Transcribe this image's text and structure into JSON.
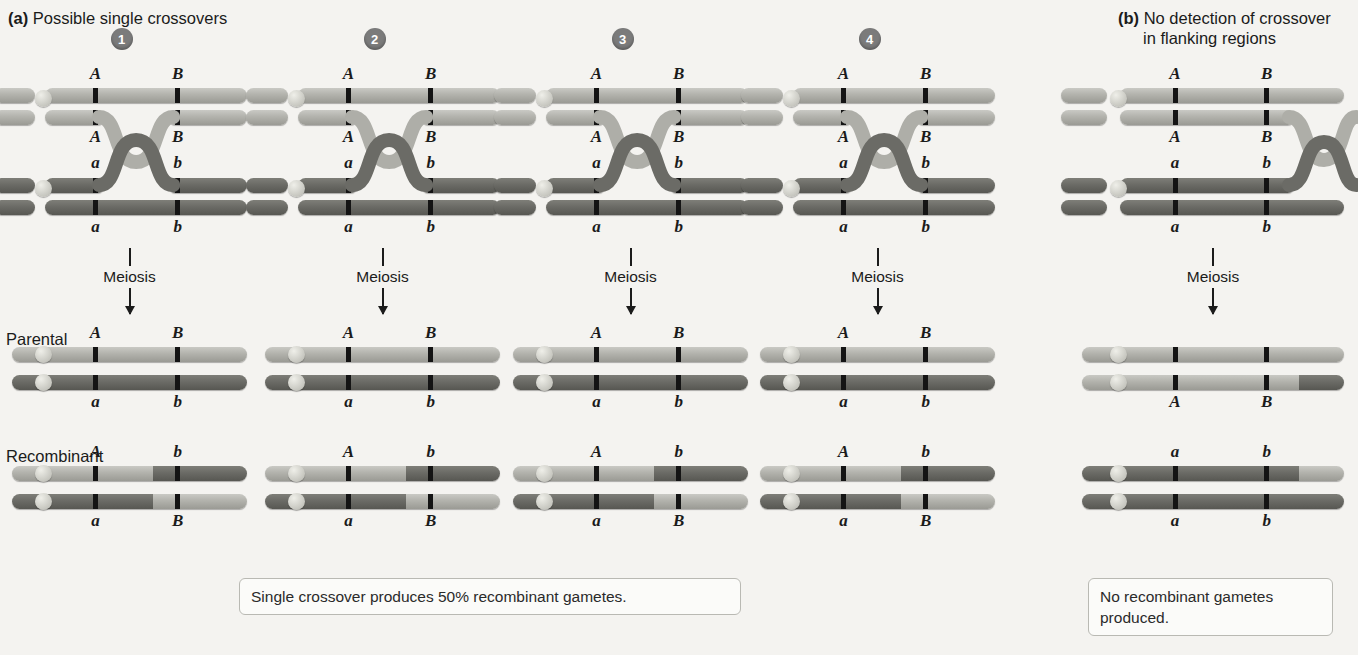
{
  "figure": {
    "background": "#f4f3f0",
    "light_chromatid_color": "#b2b2ac",
    "dark_chromatid_color": "#6b6b66",
    "marker_color": "#141414",
    "badge_color": "#7b7b7b"
  },
  "panels": {
    "a": {
      "tag": "(a)",
      "title": "Possible single crossovers"
    },
    "b": {
      "tag": "(b)",
      "title_line1": "No detection of crossover",
      "title_line2": "in flanking regions"
    }
  },
  "row_labels": {
    "parental": "Parental",
    "recombinant": "Recombinant"
  },
  "meiosis_label": "Meiosis",
  "alleles": {
    "A_upper": "A",
    "B_upper": "B",
    "a_lower": "a",
    "b_lower": "b"
  },
  "columns": [
    {
      "id": 1,
      "badge": "1",
      "tetrad": {
        "top_labels_above": [
          "A",
          "B"
        ],
        "top_labels_below": [
          "A",
          "B"
        ],
        "bottom_labels_above": [
          "a",
          "b"
        ],
        "bottom_labels_below": [
          "a",
          "b"
        ],
        "crossover_type": "inner-chromatids-single"
      },
      "parental": [
        {
          "labels_above": [
            "A",
            "B"
          ],
          "shade": "light"
        },
        {
          "labels_below": [
            "a",
            "b"
          ],
          "shade": "dark"
        }
      ],
      "recombinant": [
        {
          "labels_above": [
            "A",
            "b"
          ],
          "shade": "light-then-dark"
        },
        {
          "labels_below": [
            "a",
            "B"
          ],
          "shade": "dark-then-light"
        }
      ]
    },
    {
      "id": 2,
      "badge": "2",
      "tetrad": {
        "top_labels_above": [
          "A",
          "B"
        ],
        "top_labels_below": [
          "A",
          "B"
        ],
        "bottom_labels_above": [
          "a",
          "b"
        ],
        "bottom_labels_below": [
          "a",
          "b"
        ],
        "crossover_type": "inner-chromatids-single"
      },
      "parental": [
        {
          "labels_above": [
            "A",
            "B"
          ],
          "shade": "light"
        },
        {
          "labels_below": [
            "a",
            "b"
          ],
          "shade": "dark"
        }
      ],
      "recombinant": [
        {
          "labels_above": [
            "A",
            "b"
          ],
          "shade": "light-then-dark"
        },
        {
          "labels_below": [
            "a",
            "B"
          ],
          "shade": "dark-then-light"
        }
      ]
    },
    {
      "id": 3,
      "badge": "3",
      "tetrad": {
        "top_labels_above": [
          "A",
          "B"
        ],
        "top_labels_below": [
          "A",
          "B"
        ],
        "bottom_labels_above": [
          "a",
          "b"
        ],
        "bottom_labels_below": [
          "a",
          "b"
        ],
        "crossover_type": "inner-chromatids-single"
      },
      "parental": [
        {
          "labels_above": [
            "A",
            "B"
          ],
          "shade": "light"
        },
        {
          "labels_below": [
            "a",
            "b"
          ],
          "shade": "dark"
        }
      ],
      "recombinant": [
        {
          "labels_above": [
            "A",
            "b"
          ],
          "shade": "light-then-dark"
        },
        {
          "labels_below": [
            "a",
            "B"
          ],
          "shade": "dark-then-light"
        }
      ]
    },
    {
      "id": 4,
      "badge": "4",
      "tetrad": {
        "top_labels_above": [
          "A",
          "B"
        ],
        "top_labels_below": [
          "A",
          "B"
        ],
        "bottom_labels_above": [
          "a",
          "b"
        ],
        "bottom_labels_below": [
          "a",
          "b"
        ],
        "crossover_type": "inner-chromatids-single"
      },
      "parental": [
        {
          "labels_above": [
            "A",
            "B"
          ],
          "shade": "light"
        },
        {
          "labels_below": [
            "a",
            "b"
          ],
          "shade": "dark"
        }
      ],
      "recombinant": [
        {
          "labels_above": [
            "A",
            "b"
          ],
          "shade": "light-then-dark"
        },
        {
          "labels_below": [
            "a",
            "B"
          ],
          "shade": "dark-then-light"
        }
      ]
    },
    {
      "id": 5,
      "badge": null,
      "tetrad": {
        "top_labels_above": [
          "A",
          "B"
        ],
        "top_labels_below": [
          "A",
          "B"
        ],
        "bottom_labels_above": [
          "a",
          "b"
        ],
        "bottom_labels_below": [
          "a",
          "b"
        ],
        "crossover_type": "flanking-region-right-of-B"
      },
      "parental": [
        {
          "labels": [],
          "shade": "light"
        },
        {
          "labels_below": [
            "A",
            "B"
          ],
          "shade": "light-with-dark-tip"
        }
      ],
      "recombinant": [
        {
          "labels_above": [
            "a",
            "b"
          ],
          "shade": "dark-with-light-tip"
        },
        {
          "labels_below": [
            "a",
            "b"
          ],
          "shade": "dark"
        }
      ]
    }
  ],
  "captions": {
    "a": "Single crossover produces 50% recombinant gametes.",
    "b_line1": "No recombinant gametes",
    "b_line2": "produced."
  }
}
